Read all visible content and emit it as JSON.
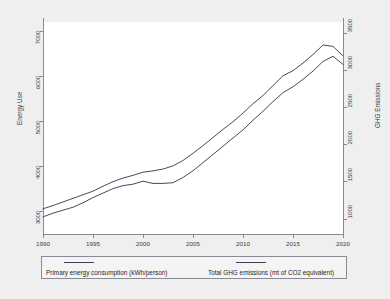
{
  "chart_data": {
    "type": "line",
    "title": "",
    "xlabel": "",
    "ylabel": "Energy Use",
    "y2label": "GHG Emissions",
    "grid": false,
    "legend_position": "bottom",
    "xlim": [
      1990,
      2020
    ],
    "ylim": [
      2500,
      7200
    ],
    "y2lim": [
      800,
      3650
    ],
    "xticks": [
      "1990",
      "1995",
      "2000",
      "2005",
      "2010",
      "2015",
      "2020"
    ],
    "yticks": [
      "3000",
      "4000",
      "5000",
      "6000",
      "7000"
    ],
    "y2ticks": [
      "1000",
      "1500",
      "2000",
      "2500",
      "3000",
      "3500"
    ],
    "x": [
      1990,
      1991,
      1992,
      1993,
      1994,
      1995,
      1996,
      1997,
      1998,
      1999,
      2000,
      2001,
      2002,
      2003,
      2004,
      2005,
      2006,
      2007,
      2008,
      2009,
      2010,
      2011,
      2012,
      2013,
      2014,
      2015,
      2016,
      2017,
      2018,
      2019,
      2020
    ],
    "series": [
      {
        "name": "Primary energy consumption (kWh/person)",
        "axis": "left",
        "color": "#3f3f55",
        "values": [
          3060,
          3130,
          3210,
          3290,
          3370,
          3450,
          3560,
          3660,
          3740,
          3800,
          3870,
          3900,
          3940,
          4010,
          4130,
          4290,
          4460,
          4640,
          4820,
          4990,
          5180,
          5390,
          5570,
          5790,
          6010,
          6120,
          6290,
          6480,
          6690,
          6660,
          6450
        ]
      },
      {
        "name": "Total GHG emissions (mt of CO2 equivalent)",
        "axis": "right",
        "color": "#3f3f55",
        "values": [
          1030,
          1080,
          1120,
          1160,
          1220,
          1290,
          1350,
          1410,
          1450,
          1470,
          1510,
          1480,
          1480,
          1490,
          1560,
          1650,
          1760,
          1870,
          1980,
          2090,
          2200,
          2330,
          2450,
          2580,
          2700,
          2780,
          2880,
          2990,
          3120,
          3190,
          3080
        ]
      }
    ]
  },
  "legend": {
    "entries": [
      {
        "label": "Primary energy consumption (kWh/person)"
      },
      {
        "label": "Total GHG emissions (mt of CO2 equivalent)"
      }
    ]
  }
}
